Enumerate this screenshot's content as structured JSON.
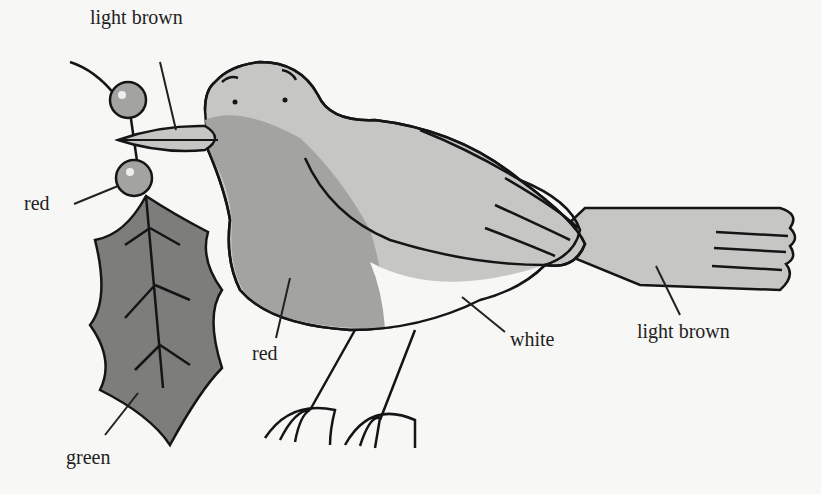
{
  "diagram": {
    "colors": {
      "background": "#f7f7f5",
      "light_brown": "#c6c6c4",
      "red": "#a3a3a1",
      "green": "#7d7d7b",
      "white": "#f7f7f5",
      "outline": "#151515"
    },
    "labels": [
      {
        "id": "beak",
        "text": "light brown"
      },
      {
        "id": "berry",
        "text": "red"
      },
      {
        "id": "leaf",
        "text": "green"
      },
      {
        "id": "breast",
        "text": "red"
      },
      {
        "id": "belly",
        "text": "white"
      },
      {
        "id": "tail",
        "text": "light brown"
      }
    ]
  }
}
